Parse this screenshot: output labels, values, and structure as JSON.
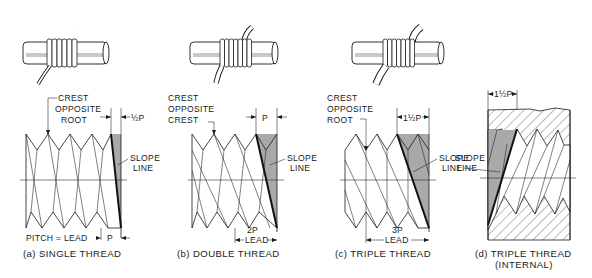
{
  "figure": {
    "panels": [
      {
        "id": "a",
        "caption": "(a) SINGLE THREAD",
        "callout": [
          "CREST",
          "OPPOSITE",
          "ROOT"
        ],
        "slope_label": [
          "SLOPE",
          "LINE"
        ],
        "top_dim": "½P",
        "bottom_dim_left": "PITCH = LEAD",
        "bottom_dim_right": "P",
        "starts": 1
      },
      {
        "id": "b",
        "caption": "(b) DOUBLE THREAD",
        "callout": [
          "CREST",
          "OPPOSITE",
          "CREST"
        ],
        "slope_label": [
          "SLOPE",
          "LINE"
        ],
        "top_dim": "P",
        "bottom_dim_top": "2P",
        "bottom_dim": "LEAD",
        "starts": 2
      },
      {
        "id": "c",
        "caption": "(c) TRIPLE THREAD",
        "callout": [
          "CREST",
          "OPPOSITE",
          "ROOT"
        ],
        "slope_label": [
          "SLOPE",
          "LINE"
        ],
        "top_dim": "1½P",
        "bottom_dim_top": "3P",
        "bottom_dim": "LEAD",
        "starts": 3
      },
      {
        "id": "d",
        "caption": "(d) TRIPLE THREAD",
        "caption_sub": "(INTERNAL)",
        "slope_label": [
          "SLOPE",
          "LINE"
        ],
        "top_dim": "1½P",
        "starts": 3
      }
    ],
    "colors": {
      "ink": "#1a1a1a",
      "shade": "#a9a9a9",
      "background": "#ffffff"
    }
  }
}
